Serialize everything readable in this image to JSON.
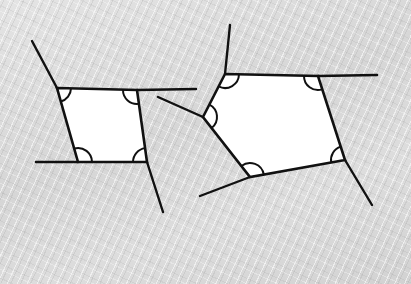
{
  "canvas": {
    "width": 411,
    "height": 284,
    "background_color": "#dcdcdc",
    "paper_texture": "diagonal-fiber-grain"
  },
  "style": {
    "line_color": "#111111",
    "shape_fill": "#ffffff",
    "shape_stroke_width": 2.6,
    "ray_stroke_width": 2.4,
    "arc_stroke_width": 2.0
  },
  "figures": [
    {
      "name": "left-parallelogram",
      "type": "quadrilateral",
      "vertex_count": 4,
      "vertices": [
        {
          "label": "top-left",
          "x": 57,
          "y": 88
        },
        {
          "label": "top-right",
          "x": 137,
          "y": 90
        },
        {
          "label": "bottom-right",
          "x": 147,
          "y": 162
        },
        {
          "label": "bottom-left",
          "x": 78,
          "y": 162
        }
      ],
      "rays": [
        {
          "name": "upper-left-ray",
          "from": {
            "x": 57,
            "y": 88
          },
          "to": {
            "x": 32,
            "y": 41
          }
        },
        {
          "name": "upper-right-ray",
          "from": {
            "x": 137,
            "y": 90
          },
          "to": {
            "x": 196,
            "y": 89
          }
        },
        {
          "name": "lower-left-ray",
          "from": {
            "x": 78,
            "y": 162
          },
          "to": {
            "x": 36,
            "y": 162
          }
        },
        {
          "name": "lower-right-ray",
          "from": {
            "x": 147,
            "y": 162
          },
          "to": {
            "x": 163,
            "y": 212
          }
        }
      ],
      "angle_arcs": [
        {
          "name": "arc-top-left",
          "at": {
            "x": 57,
            "y": 88
          },
          "radius": 14
        },
        {
          "name": "arc-top-right",
          "at": {
            "x": 137,
            "y": 90
          },
          "radius": 14
        },
        {
          "name": "arc-bottom-right",
          "at": {
            "x": 147,
            "y": 162
          },
          "radius": 14
        },
        {
          "name": "arc-bottom-left",
          "at": {
            "x": 78,
            "y": 162
          },
          "radius": 14
        }
      ]
    },
    {
      "name": "right-pentagon",
      "type": "pentagon",
      "vertex_count": 5,
      "vertices": [
        {
          "label": "top-left",
          "x": 225,
          "y": 74
        },
        {
          "label": "top-right",
          "x": 318,
          "y": 76
        },
        {
          "label": "right",
          "x": 345,
          "y": 160
        },
        {
          "label": "bottom",
          "x": 250,
          "y": 177
        },
        {
          "label": "left",
          "x": 203,
          "y": 117
        }
      ],
      "rays": [
        {
          "name": "top-left-up-ray",
          "from": {
            "x": 225,
            "y": 74
          },
          "to": {
            "x": 230,
            "y": 25
          }
        },
        {
          "name": "top-right-ray",
          "from": {
            "x": 318,
            "y": 76
          },
          "to": {
            "x": 377,
            "y": 75
          }
        },
        {
          "name": "right-down-ray",
          "from": {
            "x": 345,
            "y": 160
          },
          "to": {
            "x": 372,
            "y": 205
          }
        },
        {
          "name": "bottom-left-ray",
          "from": {
            "x": 250,
            "y": 177
          },
          "to": {
            "x": 200,
            "y": 196
          }
        },
        {
          "name": "left-upper-ray",
          "from": {
            "x": 203,
            "y": 117
          },
          "to": {
            "x": 158,
            "y": 97
          }
        }
      ],
      "angle_arcs": [
        {
          "name": "arc-top-left",
          "at": {
            "x": 225,
            "y": 74
          },
          "radius": 14
        },
        {
          "name": "arc-top-right",
          "at": {
            "x": 318,
            "y": 76
          },
          "radius": 14
        },
        {
          "name": "arc-right",
          "at": {
            "x": 345,
            "y": 160
          },
          "radius": 14
        },
        {
          "name": "arc-bottom",
          "at": {
            "x": 250,
            "y": 177
          },
          "radius": 14
        },
        {
          "name": "arc-left",
          "at": {
            "x": 203,
            "y": 117
          },
          "radius": 14
        }
      ]
    }
  ],
  "labels": {
    "caption": "",
    "figure_left_name": "",
    "figure_right_name": ""
  }
}
